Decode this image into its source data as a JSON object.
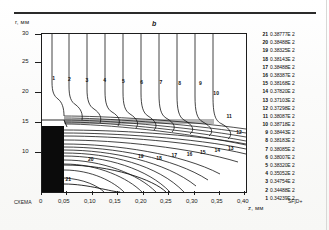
{
  "figure": {
    "panel_letter": "b",
    "top_rule": true
  },
  "axes": {
    "y_axis_label": "r, мм",
    "x_axis_label": "z, мм",
    "y_ticks": [
      "30",
      "25",
      "20",
      "15",
      "10"
    ],
    "y_tick_values": [
      30,
      25,
      20,
      15,
      10
    ],
    "x_ticks": [
      "0",
      "0,05",
      "0,10",
      "0,15",
      "0,20",
      "0,25",
      "0,30",
      "0,35",
      "0,40"
    ],
    "x_tick_values": [
      0,
      0.05,
      0.1,
      0.15,
      0.2,
      0.25,
      0.3,
      0.35,
      0.4
    ]
  },
  "annotations": {
    "bottom_left": "СХЕМА",
    "bottom_right": "SF[D+"
  },
  "curve_labels": [
    {
      "text": "21",
      "x": 0.115,
      "y": 0.905
    },
    {
      "text": "20",
      "x": 0.225,
      "y": 0.78
    },
    {
      "text": "19",
      "x": 0.47,
      "y": 0.762
    },
    {
      "text": "18",
      "x": 0.56,
      "y": 0.77
    },
    {
      "text": "17",
      "x": 0.635,
      "y": 0.755
    },
    {
      "text": "16",
      "x": 0.71,
      "y": 0.745
    },
    {
      "text": "15",
      "x": 0.775,
      "y": 0.735
    },
    {
      "text": "14",
      "x": 0.845,
      "y": 0.722
    },
    {
      "text": "13",
      "x": 0.912,
      "y": 0.706
    },
    {
      "text": "12",
      "x": 0.952,
      "y": 0.608
    },
    {
      "text": "11",
      "x": 0.905,
      "y": 0.505
    },
    {
      "text": "10",
      "x": 0.84,
      "y": 0.36
    },
    {
      "text": "9",
      "x": 0.77,
      "y": 0.3
    },
    {
      "text": "8",
      "x": 0.668,
      "y": 0.298
    },
    {
      "text": "7",
      "x": 0.576,
      "y": 0.292
    },
    {
      "text": "6",
      "x": 0.482,
      "y": 0.288
    },
    {
      "text": "5",
      "x": 0.392,
      "y": 0.284
    },
    {
      "text": "4",
      "x": 0.3,
      "y": 0.28
    },
    {
      "text": "3",
      "x": 0.213,
      "y": 0.276
    },
    {
      "text": "2",
      "x": 0.128,
      "y": 0.272
    },
    {
      "text": "1",
      "x": 0.05,
      "y": 0.268
    }
  ],
  "legend": {
    "entries": [
      {
        "index": "21",
        "value": "0.38777E 2"
      },
      {
        "index": "20",
        "value": "0.38488E 2"
      },
      {
        "index": "19",
        "value": "0.38325E 2"
      },
      {
        "index": "18",
        "value": "0.38143E 2"
      },
      {
        "index": "17",
        "value": "0.38488E 2"
      },
      {
        "index": "16",
        "value": "0.38387E 2"
      },
      {
        "index": "15",
        "value": "0.38168E 2"
      },
      {
        "index": "14",
        "value": "0.37820E 2"
      },
      {
        "index": "13",
        "value": "0.37103E 2"
      },
      {
        "index": "12",
        "value": "0.37298E 2"
      },
      {
        "index": "11",
        "value": "0.38087E 2"
      },
      {
        "index": "10",
        "value": "0.38718E 2"
      },
      {
        "index": "9",
        "value": "0.38443E 2"
      },
      {
        "index": "8",
        "value": "0.38183E 2"
      },
      {
        "index": "7",
        "value": "0.38085E 2"
      },
      {
        "index": "6",
        "value": "0.38007E 2"
      },
      {
        "index": "5",
        "value": "0.38320E 2"
      },
      {
        "index": "4",
        "value": "0.35052E 2"
      },
      {
        "index": "3",
        "value": "0.34754E 2"
      },
      {
        "index": "2",
        "value": "0.34488E 2"
      },
      {
        "index": "1",
        "value": "0.34239E 2"
      }
    ]
  },
  "chart_data": {
    "type": "line",
    "title": "b",
    "xlabel": "z, мм",
    "ylabel": "r, мм",
    "xlim": [
      0,
      0.4
    ],
    "ylim": [
      8.5,
      30
    ],
    "grid": false,
    "legend_position": "right",
    "categories": [
      "1",
      "2",
      "3",
      "4",
      "5",
      "6",
      "7",
      "8",
      "9",
      "10",
      "11",
      "12",
      "13",
      "14",
      "15",
      "16",
      "17",
      "18",
      "19",
      "20",
      "21"
    ],
    "values": [
      34.239,
      34.488,
      34.754,
      35.052,
      38.32,
      38.007,
      38.085,
      38.183,
      38.443,
      38.718,
      38.087,
      37.298,
      37.103,
      37.82,
      38.168,
      38.387,
      38.488,
      38.143,
      38.325,
      38.488,
      38.777
    ],
    "series": [
      {
        "name": "contour-levels",
        "values": [
          34.239,
          34.488,
          34.754,
          35.052,
          38.32,
          38.007,
          38.085,
          38.183,
          38.443,
          38.718,
          38.087,
          37.298,
          37.103,
          37.82,
          38.168,
          38.387,
          38.488,
          38.143,
          38.325,
          38.488,
          38.777
        ]
      }
    ]
  }
}
